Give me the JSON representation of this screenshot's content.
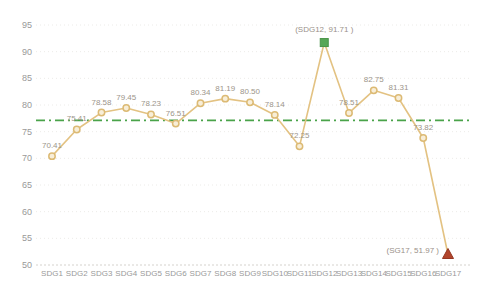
{
  "chart_data": {
    "type": "line",
    "title": "",
    "xlabel": "",
    "ylabel": "",
    "categories": [
      "SDG1",
      "SDG2",
      "SDG3",
      "SDG4",
      "SDG5",
      "SDG6",
      "SDG7",
      "SDG8",
      "SDG9",
      "SDG10",
      "SDG11",
      "SDG12",
      "SDG13",
      "SDG14",
      "SDG15",
      "SDG16",
      "SDG17"
    ],
    "values": [
      70.41,
      75.41,
      78.58,
      79.45,
      78.23,
      76.51,
      80.34,
      81.19,
      80.5,
      78.14,
      72.25,
      91.71,
      78.51,
      82.75,
      81.31,
      73.82,
      51.97
    ],
    "point_labels": [
      "70.41",
      "75.41",
      "78.58",
      "79.45",
      "78.23",
      "76.51",
      "80.34",
      "81.19",
      "80.50",
      "78.14",
      "72.25",
      "",
      "78.51",
      "82.75",
      "81.31",
      "73.82",
      ""
    ],
    "ylim": [
      50,
      95
    ],
    "yticks": [
      50,
      55,
      60,
      65,
      70,
      75,
      80,
      85,
      90,
      95
    ],
    "grid": true,
    "legend_position": "none",
    "reference_line": {
      "value": 77.12,
      "style": "dash-dot",
      "color": "#4aa34a"
    },
    "max_annotation": {
      "index": 11,
      "label": "(SDG12, 91.71 )",
      "marker": "square",
      "marker_color": "#57a757"
    },
    "min_annotation": {
      "index": 16,
      "label": "(SG17, 51.97 )",
      "marker": "triangle",
      "marker_color": "#b2452c"
    },
    "colors": {
      "line": "#e3c282",
      "marker_fill": "#f8eed8",
      "marker_stroke": "#dcba74",
      "max_marker_fill": "#57a757",
      "max_marker_stroke": "#4a9449",
      "min_marker_fill": "#b2452c",
      "min_marker_stroke": "#953722",
      "data_label": "#9c958a",
      "annotation_label": "#9a9189",
      "axis_label": "#999999",
      "grid_line": "#ecebe8",
      "axis_line": "#d5d2cd",
      "background": "#ffffff"
    }
  }
}
